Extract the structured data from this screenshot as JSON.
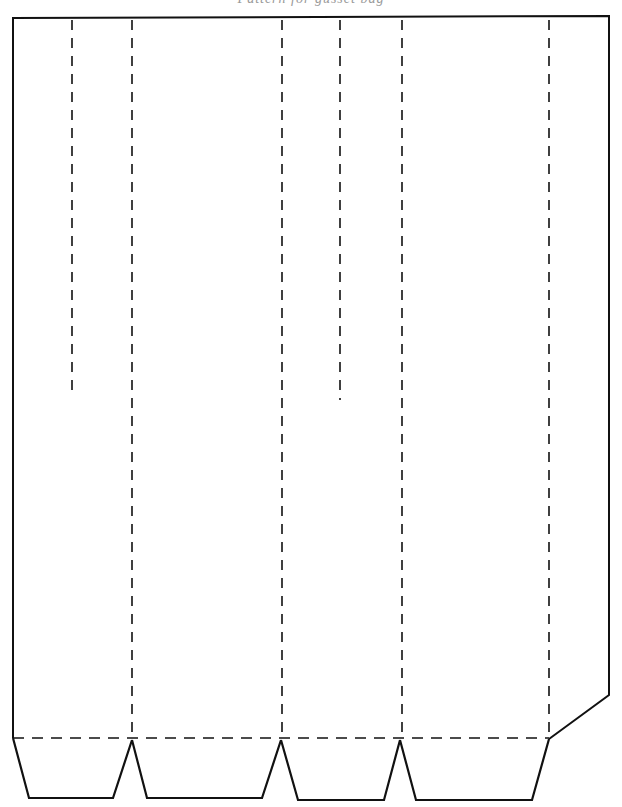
{
  "header": {
    "clipped_text": "Pattern for gusset bag"
  },
  "diagram": {
    "type": "paper-bag-cut-template",
    "stroke_color": "#111111",
    "background_color": "#ffffff",
    "outline": {
      "points": [
        [
          13,
          738
        ],
        [
          13,
          18
        ],
        [
          609,
          16
        ],
        [
          609,
          695
        ],
        [
          549,
          739
        ]
      ]
    },
    "fold_lines_full": [
      {
        "x": 132,
        "y1": 20,
        "y2": 738
      },
      {
        "x": 282,
        "y1": 20,
        "y2": 738
      },
      {
        "x": 402,
        "y1": 20,
        "y2": 738
      },
      {
        "x": 549,
        "y1": 20,
        "y2": 738
      }
    ],
    "fold_lines_partial": [
      {
        "x": 72,
        "y1": 20,
        "y2": 395
      },
      {
        "x": 340,
        "y1": 20,
        "y2": 400
      }
    ],
    "bottom_fold_line": {
      "y": 738,
      "x1": 13,
      "x2": 549
    },
    "bottom_flaps": [
      {
        "points": [
          [
            13,
            738
          ],
          [
            29,
            798
          ],
          [
            113,
            798
          ],
          [
            132,
            740
          ]
        ]
      },
      {
        "points": [
          [
            132,
            740
          ],
          [
            147,
            798
          ],
          [
            262,
            798
          ],
          [
            281,
            740
          ]
        ]
      },
      {
        "points": [
          [
            281,
            740
          ],
          [
            298,
            800
          ],
          [
            384,
            800
          ],
          [
            400,
            740
          ]
        ]
      },
      {
        "points": [
          [
            400,
            740
          ],
          [
            416,
            800
          ],
          [
            532,
            800
          ],
          [
            549,
            739
          ]
        ]
      }
    ]
  }
}
